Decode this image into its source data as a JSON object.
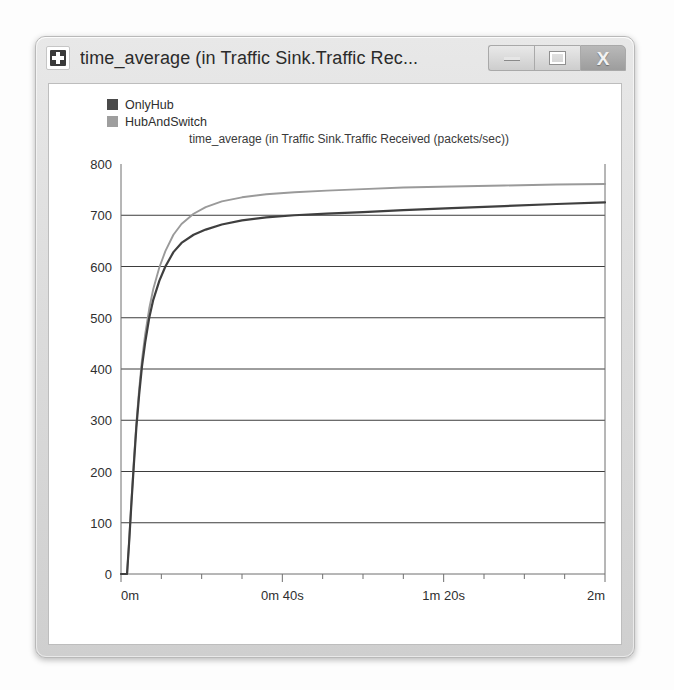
{
  "window": {
    "title": "time_average (in Traffic Sink.Traffic Rec...",
    "icon": "app-plus-icon",
    "buttons": {
      "minimize": "–",
      "maximize": "□",
      "close": "X"
    }
  },
  "legend": {
    "items": [
      {
        "label": "OnlyHub",
        "color": "#4a4a4a"
      },
      {
        "label": "HubAndSwitch",
        "color": "#9e9e9e"
      }
    ]
  },
  "chart_data": {
    "type": "line",
    "title": "time_average (in Traffic Sink.Traffic Received (packets/sec))",
    "xlabel": "",
    "ylabel": "",
    "grid": true,
    "legend_position": "top-left",
    "ylim": [
      0,
      800
    ],
    "yticks": [
      0,
      100,
      200,
      300,
      400,
      500,
      600,
      700,
      800
    ],
    "ytick_labels": [
      "0",
      "100",
      "200",
      "300",
      "400",
      "500",
      "600",
      "700",
      "800"
    ],
    "xlim": [
      0,
      120
    ],
    "xtick_labels": [
      "0m",
      "0m 40s",
      "1m 20s",
      "2m"
    ],
    "xtick_values": [
      0,
      40,
      80,
      120
    ],
    "xminor_values": [
      10,
      20,
      30,
      50,
      60,
      70,
      90,
      100,
      110
    ],
    "x_unit": "seconds",
    "series": [
      {
        "name": "OnlyHub",
        "color": "#3f3f3f",
        "x": [
          0,
          1.5,
          2.0,
          2.6,
          3.2,
          3.8,
          4.5,
          5.2,
          6.0,
          7.0,
          8.0,
          9.5,
          11,
          13,
          15,
          18,
          21,
          25,
          30,
          36,
          43,
          51,
          60,
          70,
          82,
          95,
          108,
          120
        ],
        "values": [
          0,
          0,
          60,
          140,
          215,
          285,
          350,
          405,
          452,
          500,
          535,
          572,
          600,
          628,
          646,
          662,
          672,
          682,
          690,
          696,
          700,
          703,
          706,
          710,
          714,
          718,
          722,
          725
        ]
      },
      {
        "name": "HubAndSwitch",
        "color": "#9a9a9a",
        "x": [
          0,
          1.5,
          2.0,
          2.6,
          3.2,
          3.8,
          4.5,
          5.2,
          6.0,
          7.0,
          8.0,
          9.5,
          11,
          13,
          15,
          18,
          21,
          25,
          30,
          36,
          43,
          51,
          60,
          70,
          82,
          95,
          108,
          120
        ],
        "values": [
          0,
          0,
          62,
          145,
          222,
          293,
          360,
          418,
          468,
          518,
          556,
          598,
          630,
          662,
          683,
          703,
          716,
          727,
          735,
          741,
          745,
          748,
          751,
          754,
          756,
          758,
          760,
          761
        ]
      }
    ]
  }
}
